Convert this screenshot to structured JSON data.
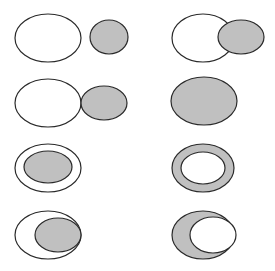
{
  "diagram": {
    "title": "",
    "colors": {
      "gray_fill": "#c0c0c0",
      "white_fill": "#ffffff",
      "stroke": "#2a2a2a"
    },
    "panels": [
      {
        "id": "r1-left",
        "relation": "disjoint",
        "shapes": [
          {
            "role": "region-a",
            "cx": 48,
            "cy": 38,
            "rx": 33,
            "ry": 24,
            "fill": "#ffffff"
          },
          {
            "role": "region-b",
            "cx": 109,
            "cy": 37,
            "rx": 19,
            "ry": 17,
            "fill": "#c0c0c0"
          }
        ]
      },
      {
        "id": "r1-right",
        "relation": "overlap",
        "shapes": [
          {
            "role": "region-a",
            "cx": 203,
            "cy": 38,
            "rx": 31,
            "ry": 24,
            "fill": "#ffffff"
          },
          {
            "role": "region-b",
            "cx": 241,
            "cy": 37,
            "rx": 23,
            "ry": 17,
            "fill": "#c0c0c0"
          }
        ]
      },
      {
        "id": "r2-left",
        "relation": "externally-tangent",
        "shapes": [
          {
            "role": "region-a",
            "cx": 48,
            "cy": 103,
            "rx": 33,
            "ry": 24,
            "fill": "#ffffff"
          },
          {
            "role": "region-b",
            "cx": 104,
            "cy": 103,
            "rx": 23,
            "ry": 17,
            "fill": "#c0c0c0"
          }
        ]
      },
      {
        "id": "r2-right",
        "relation": "equal",
        "shapes": [
          {
            "role": "region-a",
            "cx": 204,
            "cy": 101,
            "rx": 33,
            "ry": 24,
            "fill": "#c0c0c0"
          }
        ]
      },
      {
        "id": "r3-left",
        "relation": "contains-inside",
        "shapes": [
          {
            "role": "outer",
            "cx": 48,
            "cy": 168,
            "rx": 33,
            "ry": 24,
            "fill": "#ffffff"
          },
          {
            "role": "inner",
            "cx": 48,
            "cy": 167,
            "rx": 24,
            "ry": 16,
            "fill": "#c0c0c0"
          }
        ]
      },
      {
        "id": "r3-right",
        "relation": "inside-ring",
        "shapes": [
          {
            "role": "outer",
            "cx": 203,
            "cy": 168,
            "rx": 31,
            "ry": 24,
            "fill": "#c0c0c0"
          },
          {
            "role": "inner",
            "cx": 203,
            "cy": 168,
            "rx": 22,
            "ry": 16,
            "fill": "#ffffff"
          }
        ]
      },
      {
        "id": "r4-left",
        "relation": "contains-internally-tangent",
        "shapes": [
          {
            "role": "outer",
            "cx": 48,
            "cy": 235,
            "rx": 33,
            "ry": 24,
            "fill": "#ffffff"
          },
          {
            "role": "inner",
            "cx": 58,
            "cy": 235,
            "rx": 23,
            "ry": 17,
            "fill": "#c0c0c0"
          }
        ]
      },
      {
        "id": "r4-right",
        "relation": "internally-tangent-crescent",
        "shapes": [
          {
            "role": "outer",
            "cx": 203,
            "cy": 235,
            "rx": 31,
            "ry": 24,
            "fill": "#c0c0c0"
          },
          {
            "role": "inner",
            "cx": 213,
            "cy": 235,
            "rx": 23,
            "ry": 18,
            "fill": "#ffffff"
          }
        ]
      }
    ]
  }
}
